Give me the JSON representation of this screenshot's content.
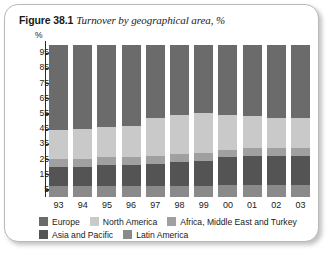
{
  "caption": {
    "figure_number": "Figure 38.1",
    "title": "Turnover by geographical area, %"
  },
  "chart_data": {
    "type": "bar",
    "subtype": "stacked-percentage-column",
    "title": "Turnover by geographical area, %",
    "xlabel": "",
    "ylabel": "%",
    "ylim": [
      0,
      100
    ],
    "yticks": [
      5,
      15,
      25,
      35,
      45,
      55,
      65,
      75,
      85,
      95
    ],
    "ytick_labels": [
      "5",
      "15",
      "25",
      "35",
      "45",
      "55",
      "65",
      "75",
      "85",
      "95"
    ],
    "grid": false,
    "legend_position": "bottom",
    "categories": [
      "93",
      "94",
      "95",
      "96",
      "97",
      "98",
      "99",
      "00",
      "01",
      "02",
      "03"
    ],
    "series": [
      {
        "name": "Europe",
        "color": "#6b6b6b",
        "values": [
          56,
          55,
          54,
          53,
          48,
          46,
          45,
          46,
          47,
          48,
          48
        ]
      },
      {
        "name": "North America",
        "color": "#c9c9c9",
        "values": [
          19,
          20,
          20,
          21,
          25,
          26,
          26,
          23,
          21,
          20,
          20
        ]
      },
      {
        "name": "Africa, Middle East and Turkey",
        "color": "#a0a0a0",
        "values": [
          5,
          5,
          5,
          5,
          5,
          5,
          5,
          5,
          5,
          5,
          5
        ]
      },
      {
        "name": "Asia and Pacific",
        "color": "#545454",
        "values": [
          13,
          13,
          14,
          14,
          15,
          16,
          17,
          18,
          19,
          19,
          19
        ]
      },
      {
        "name": "Latin America",
        "color": "#8a8a8a",
        "values": [
          7,
          7,
          7,
          7,
          7,
          7,
          7,
          8,
          8,
          8,
          8
        ]
      }
    ]
  },
  "legend": {
    "rows": [
      [
        {
          "label": "Europe",
          "color": "#6b6b6b"
        },
        {
          "label": "North America",
          "color": "#c9c9c9"
        },
        {
          "label": "Africa, Middle East and Turkey",
          "color": "#a0a0a0"
        }
      ],
      [
        {
          "label": "Asia and Pacific",
          "color": "#545454"
        },
        {
          "label": "Latin America",
          "color": "#8a8a8a"
        }
      ]
    ]
  }
}
